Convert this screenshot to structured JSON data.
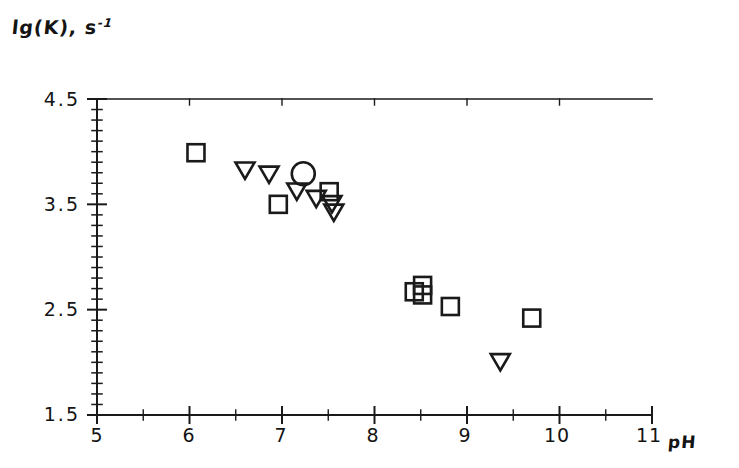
{
  "figure": {
    "title": "",
    "y_axis_label": "lg(K), s",
    "y_axis_label_exponent": "-1",
    "x_axis_label": "pH"
  },
  "axes": {
    "x_ticks": [
      "5",
      "6",
      "7",
      "8",
      "9",
      "10",
      "11"
    ],
    "y_ticks": [
      "4.5",
      "3.5",
      "2.5",
      "1.5"
    ]
  },
  "chart_data": {
    "type": "scatter",
    "title": "",
    "xlabel": "pH",
    "ylabel": "lg(K), s^-1",
    "xlim": [
      5,
      11
    ],
    "ylim": [
      1.5,
      4.5
    ],
    "x_major_ticks": [
      5,
      6,
      7,
      8,
      9,
      10,
      11
    ],
    "x_minor_tick_step": 0.5,
    "y_major_ticks": [
      1.5,
      2.5,
      3.5,
      4.5
    ],
    "y_minor_tick_step": 0.1,
    "grid": false,
    "legend": "none",
    "series": [
      {
        "name": "square",
        "marker": "square",
        "filled": false,
        "points": [
          {
            "x": 6.07,
            "y": 3.99
          },
          {
            "x": 6.96,
            "y": 3.5
          },
          {
            "x": 7.51,
            "y": 3.62
          },
          {
            "x": 8.43,
            "y": 2.67
          },
          {
            "x": 8.52,
            "y": 2.73
          },
          {
            "x": 8.52,
            "y": 2.64
          },
          {
            "x": 8.82,
            "y": 2.53
          },
          {
            "x": 9.7,
            "y": 2.42
          }
        ]
      },
      {
        "name": "down-triangle",
        "marker": "triangle-down",
        "filled": false,
        "points": [
          {
            "x": 6.6,
            "y": 3.82
          },
          {
            "x": 6.86,
            "y": 3.78
          },
          {
            "x": 7.16,
            "y": 3.62
          },
          {
            "x": 7.37,
            "y": 3.55
          },
          {
            "x": 7.54,
            "y": 3.5
          },
          {
            "x": 7.56,
            "y": 3.42
          },
          {
            "x": 9.36,
            "y": 2.0
          }
        ]
      },
      {
        "name": "circle",
        "marker": "circle",
        "filled": false,
        "points": [
          {
            "x": 7.23,
            "y": 3.79
          }
        ]
      }
    ]
  }
}
